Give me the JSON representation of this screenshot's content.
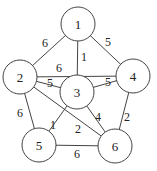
{
  "diagram": {
    "type": "weighted-undirected-graph",
    "nodes": [
      {
        "id": "1",
        "label": "1",
        "x": 78,
        "y": 24
      },
      {
        "id": "2",
        "label": "2",
        "x": 20,
        "y": 77
      },
      {
        "id": "3",
        "label": "3",
        "x": 77,
        "y": 92
      },
      {
        "id": "4",
        "label": "4",
        "x": 133,
        "y": 76
      },
      {
        "id": "5",
        "label": "5",
        "x": 39,
        "y": 145
      },
      {
        "id": "6",
        "label": "6",
        "x": 115,
        "y": 146
      }
    ],
    "edges": [
      {
        "from": "1",
        "to": "2",
        "weight": "6",
        "lx": 45,
        "ly": 43
      },
      {
        "from": "1",
        "to": "3",
        "weight": "1",
        "lx": 84,
        "ly": 57
      },
      {
        "from": "1",
        "to": "4",
        "weight": "5",
        "lx": 108,
        "ly": 42
      },
      {
        "from": "2",
        "to": "4",
        "weight": "6",
        "lx": 59,
        "ly": 68
      },
      {
        "from": "2",
        "to": "3",
        "weight": "5",
        "lx": 50,
        "ly": 83
      },
      {
        "from": "3",
        "to": "4",
        "weight": "5",
        "lx": 108,
        "ly": 82
      },
      {
        "from": "2",
        "to": "5",
        "weight": "6",
        "lx": 20,
        "ly": 113
      },
      {
        "from": "2",
        "to": "6",
        "weight": "2",
        "lx": 78,
        "ly": 129
      },
      {
        "from": "3",
        "to": "5",
        "weight": "1",
        "lx": 53,
        "ly": 125
      },
      {
        "from": "3",
        "to": "6",
        "weight": "4",
        "lx": 98,
        "ly": 117
      },
      {
        "from": "4",
        "to": "6",
        "weight": "2",
        "lx": 127,
        "ly": 117
      },
      {
        "from": "5",
        "to": "6",
        "weight": "6",
        "lx": 77,
        "ly": 154
      }
    ],
    "node_radius": 17
  }
}
